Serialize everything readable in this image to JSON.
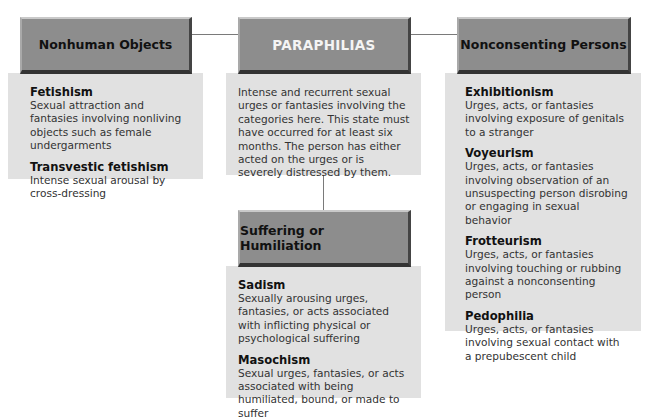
{
  "cut_off_title": "... Paraphilias",
  "center": {
    "title": "PARAPHILIAS",
    "description": "Intense and recurrent sexual urges or fantasies involving the categories here. This state must have occurred for at least six months. The person has either acted on the urges or is severely distressed by them."
  },
  "categories": [
    {
      "title": "Nonhuman Objects",
      "items": [
        {
          "term": "Fetishism",
          "description": "Sexual attraction and fantasies involving nonliving objects such as female undergarments"
        },
        {
          "term": "Transvestic fetishism",
          "description": "Intense sexual arousal by cross-dressing"
        }
      ]
    },
    {
      "title": "Nonconsenting Persons",
      "items": [
        {
          "term": "Exhibitionism",
          "description": "Urges, acts, or fantasies involving exposure of genitals to a stranger"
        },
        {
          "term": "Voyeurism",
          "description": "Urges, acts, or fantasies involving observation of an unsuspecting person disrobing or engaging in sexual behavior"
        },
        {
          "term": "Frotteurism",
          "description": "Urges, acts, or fantasies involving touching or rubbing against a nonconsenting person"
        },
        {
          "term": "Pedophilia",
          "description": "Urges, acts, or fantasies involving sexual contact with a prepubescent child"
        }
      ]
    },
    {
      "title": "Suffering or Humiliation",
      "items": [
        {
          "term": "Sadism",
          "description": "Sexually arousing urges, fantasies, or acts associated with inflicting physical or psychological suffering"
        },
        {
          "term": "Masochism",
          "description": "Sexual urges, fantasies, or acts associated with being humiliated, bound, or made to suffer"
        }
      ]
    }
  ],
  "colors": {
    "header_fill": "#8d8d8d",
    "panel_fill": "#e1e1e1",
    "connector": "#7a7a7a"
  }
}
